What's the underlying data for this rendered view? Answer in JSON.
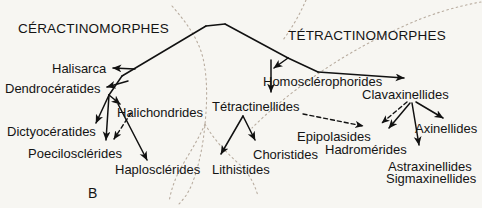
{
  "figure": {
    "panel_letter": "B",
    "background_color": "#f7f6f2",
    "line_color": "#111111",
    "dotted_color": "#b9ada0"
  },
  "clades": {
    "left": {
      "title": "CÉRACTINOMORPHES"
    },
    "right": {
      "title": "TÉTRACTINOMORPHES"
    }
  },
  "taxa": {
    "halisarca": "Halisarca",
    "dendroceratides": "Dendrocératides",
    "dictyoceratides": "Dictyocératides",
    "halichondrides": "Halichondrides",
    "poecilosclerides": "Poecilosclérides",
    "haplosclerides": "Haplosclérides",
    "homosclerophorides": "Homosclérophorides",
    "tetractinellides": "Tétractinellides",
    "choristides": "Choristides",
    "lithistides": "Lithistides",
    "clavaxinellides": "Clavaxinellides",
    "epipolasides": "Epipolasides",
    "hadromerides": "Hadromérides",
    "axinellides": "Axinellides",
    "astraxinellides": "Astraxinellides",
    "sigmaxinellides": "Sigmaxinellides"
  }
}
